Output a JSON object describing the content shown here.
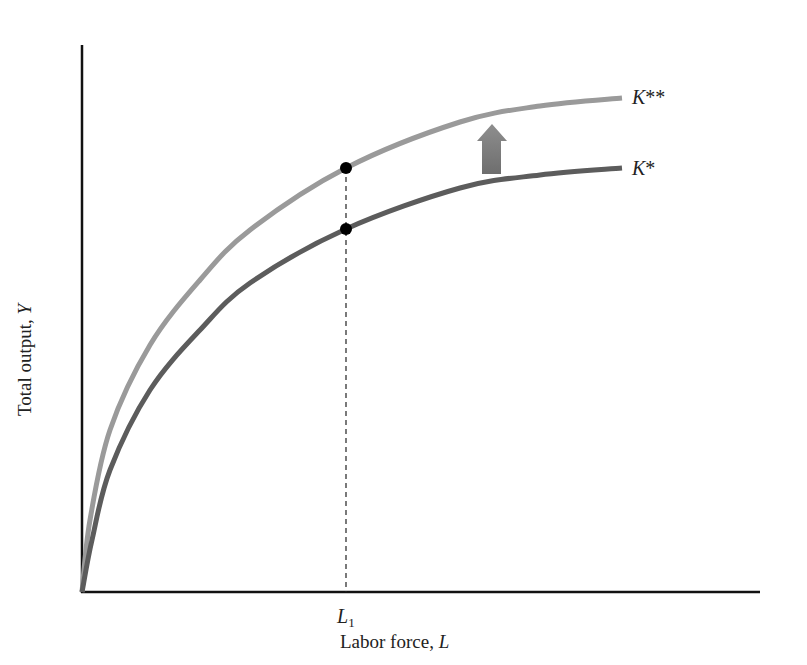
{
  "chart_data": {
    "type": "line",
    "title": "",
    "xlabel": "Labor force, L",
    "xlabel_text": "Labor force, ",
    "xlabel_var": "L",
    "ylabel": "Total output, Y",
    "ylabel_text": "Total output, ",
    "ylabel_var": "Y",
    "x_ticks": [
      {
        "label": "L1",
        "main": "L",
        "sub": "1"
      }
    ],
    "grid": false,
    "legend": "inline labels at curve ends",
    "series": [
      {
        "name": "K**",
        "main": "K",
        "stars": "**",
        "color": "#9a9a9a",
        "description": "production function with higher capital stock",
        "points_px": [
          [
            82,
            592
          ],
          [
            90,
            520
          ],
          [
            110,
            430
          ],
          [
            150,
            345
          ],
          [
            200,
            280
          ],
          [
            250,
            230
          ],
          [
            346,
            168
          ],
          [
            460,
            122
          ],
          [
            540,
            106
          ],
          [
            622,
            98
          ]
        ]
      },
      {
        "name": "K*",
        "main": "K",
        "stars": "*",
        "color": "#5c5c5c",
        "description": "production function with initial capital stock",
        "points_px": [
          [
            82,
            592
          ],
          [
            92,
            540
          ],
          [
            110,
            470
          ],
          [
            150,
            390
          ],
          [
            200,
            330
          ],
          [
            250,
            283
          ],
          [
            346,
            229
          ],
          [
            460,
            188
          ],
          [
            540,
            175
          ],
          [
            622,
            168
          ]
        ]
      }
    ],
    "annotations": [
      {
        "type": "arrow-up",
        "meaning": "shift from K* to K**",
        "color": "#7a7a7a"
      },
      {
        "type": "point",
        "at": "L1 on K**"
      },
      {
        "type": "point",
        "at": "L1 on K*"
      },
      {
        "type": "dashed-vertical",
        "at": "L1"
      }
    ]
  }
}
